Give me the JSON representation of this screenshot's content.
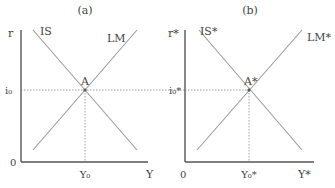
{
  "diagram": {
    "type": "IS-LM comparison",
    "panels": [
      {
        "id": "a",
        "title": "(a)",
        "y_axis_label": "r",
        "x_axis_label": "Y",
        "origin_label": "0",
        "curves": [
          {
            "name": "IS",
            "label": "IS",
            "slope": "downward"
          },
          {
            "name": "LM",
            "label": "LM",
            "slope": "upward"
          }
        ],
        "equilibrium": {
          "label": "A",
          "interest_label": "i₀",
          "output_label": "Y₀"
        }
      },
      {
        "id": "b",
        "title": "(b)",
        "y_axis_label": "r*",
        "x_axis_label": "Y*",
        "origin_label": "0",
        "curves": [
          {
            "name": "IS*",
            "label": "IS*",
            "slope": "downward"
          },
          {
            "name": "LM*",
            "label": "LM*",
            "slope": "upward"
          }
        ],
        "equilibrium": {
          "label": "A*",
          "interest_label": "i₀*",
          "output_label": "Y₀*"
        }
      }
    ],
    "colors": {
      "axis": "#555555",
      "curve": "#9a9a9a",
      "guide": "#8a8a8a",
      "text": "#444444",
      "background": "#ffffff"
    }
  }
}
